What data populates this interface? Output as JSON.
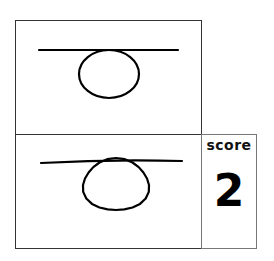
{
  "reference_drawing": {
    "shape": "horizontal line tangent to top of ellipse",
    "line": {
      "x1": 39,
      "y1": 50,
      "x2": 178,
      "y2": 50
    },
    "ellipse": {
      "cx": 109,
      "cy": 74,
      "rx": 30,
      "ry": 24
    }
  },
  "copy_drawing": {
    "shape": "hand-drawn horizontal line tangent to top of ellipse",
    "line": {
      "x1": 41,
      "y1": 163,
      "x2": 182,
      "y2": 161
    },
    "ellipse": {
      "cx": 116,
      "cy": 185,
      "rx": 33,
      "ry": 26
    }
  },
  "score": {
    "label": "score",
    "value": "2"
  },
  "colors": {
    "stroke": "#000000",
    "border": "#333333",
    "score_border": "#777777"
  }
}
